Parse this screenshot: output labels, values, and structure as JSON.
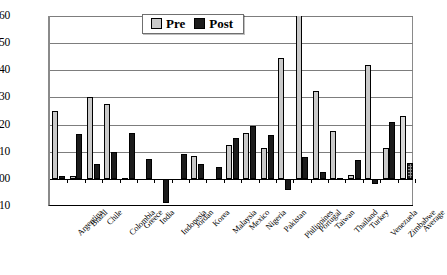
{
  "chart_data": {
    "type": "bar",
    "title": "",
    "subtitle": "",
    "xlabel": "",
    "ylabel": "",
    "ylim": [
      -0.1,
      0.6
    ],
    "ytick_values": [
      0.6,
      0.5,
      0.4,
      0.3,
      0.2,
      0.1,
      0.0,
      -0.1
    ],
    "ytick_labels": [
      "0.60",
      "0.50",
      "0.40",
      "0.30",
      "0.20",
      "0.10",
      "0.00",
      "-0.10"
    ],
    "grid": true,
    "legend_position": "top-center",
    "categories": [
      "Argentina",
      "Brazil",
      "Chile",
      "Colombia",
      "Greece",
      "India",
      "Indonesia",
      "Jordan",
      "Korea",
      "Malaysia",
      "Mexico",
      "Nigeria",
      "Pakistan",
      "Philippines",
      "Portugal",
      "Taiwan",
      "Thailand",
      "Turkey",
      "Venezuela",
      "Zimbabwe",
      "Average"
    ],
    "series": [
      {
        "name": "Pre",
        "values": [
          0.25,
          0.01,
          0.3,
          0.275,
          0.005,
          0.0,
          0.0,
          0.0,
          0.085,
          0.0,
          0.125,
          0.17,
          0.115,
          0.445,
          0.7,
          0.325,
          0.175,
          0.015,
          0.42,
          0.115,
          0.23
        ]
      },
      {
        "name": "Post",
        "values": [
          0.01,
          0.165,
          0.055,
          0.1,
          0.17,
          0.075,
          -0.09,
          0.09,
          0.055,
          0.045,
          0.15,
          0.195,
          0.16,
          -0.04,
          0.08,
          0.025,
          0.005,
          0.07,
          -0.02,
          0.21,
          0.06
        ]
      }
    ],
    "annotations": []
  },
  "legend": {
    "pre_label": "Pre",
    "post_label": "Post",
    "pre_color": "#c9c9c9",
    "post_color": "#1c1c1c"
  }
}
